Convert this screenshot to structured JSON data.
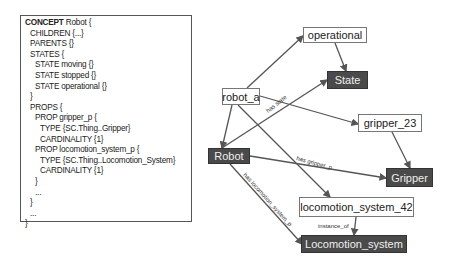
{
  "code": {
    "lines": [
      {
        "indent": 0,
        "keyword": "CONCEPT",
        "rest": " Robot {",
        "bold": true
      },
      {
        "indent": 1,
        "keyword": "CHILDREN",
        "rest": " {...}"
      },
      {
        "indent": 1,
        "keyword": "PARENTS",
        "rest": " {}"
      },
      {
        "indent": 1,
        "keyword": "STATES",
        "rest": " {"
      },
      {
        "indent": 2,
        "keyword": "STATE",
        "rest": " moving {}"
      },
      {
        "indent": 2,
        "keyword": "STATE",
        "rest": " stopped {}"
      },
      {
        "indent": 2,
        "keyword": "STATE",
        "rest": " operational {}"
      },
      {
        "indent": 1,
        "keyword": "",
        "rest": "}"
      },
      {
        "indent": 1,
        "keyword": "PROPS",
        "rest": " {"
      },
      {
        "indent": 2,
        "keyword": "PROP",
        "rest": " gripper_p {"
      },
      {
        "indent": 3,
        "keyword": "TYPE",
        "rest": " {SC.Thing..Gripper}"
      },
      {
        "indent": 3,
        "keyword": "CARDINALITY",
        "rest": " {1}"
      },
      {
        "indent": 2,
        "keyword": "PROP",
        "rest": " locomotion_system_p {"
      },
      {
        "indent": 3,
        "keyword": "TYPE",
        "rest": " {SC.Thing..Locomotion_System}"
      },
      {
        "indent": 3,
        "keyword": "CARDINALITY",
        "rest": " {1}"
      },
      {
        "indent": 2,
        "keyword": "",
        "rest": "}"
      },
      {
        "indent": 2,
        "keyword": "",
        "rest": "..."
      },
      {
        "indent": 1,
        "keyword": "",
        "rest": "}"
      },
      {
        "indent": 1,
        "keyword": "",
        "rest": "..."
      },
      {
        "indent": 0,
        "keyword": "",
        "rest": "}"
      }
    ]
  },
  "graph": {
    "nodes": [
      {
        "id": "operational",
        "label": "operational",
        "kind": "instance",
        "x": 303,
        "y": 27,
        "w": 64,
        "h": 16
      },
      {
        "id": "State",
        "label": "State",
        "kind": "concept",
        "x": 327,
        "y": 71,
        "w": 41,
        "h": 18
      },
      {
        "id": "robot_a",
        "label": "robot_a",
        "kind": "instance",
        "x": 222,
        "y": 88,
        "w": 38,
        "h": 17
      },
      {
        "id": "gripper_23",
        "label": "gripper_23",
        "kind": "instance",
        "x": 358,
        "y": 114,
        "w": 64,
        "h": 18
      },
      {
        "id": "Robot",
        "label": "Robot",
        "kind": "concept",
        "x": 208,
        "y": 148,
        "w": 42,
        "h": 16
      },
      {
        "id": "Gripper",
        "label": "Gripper",
        "kind": "concept",
        "x": 386,
        "y": 168,
        "w": 47,
        "h": 19
      },
      {
        "id": "locomotion_system_42",
        "label": "locomotion_system_42",
        "kind": "instance",
        "x": 299,
        "y": 197,
        "w": 115,
        "h": 20
      },
      {
        "id": "Locomotion_system",
        "label": "Locomotion_system",
        "kind": "concept",
        "x": 301,
        "y": 235,
        "w": 106,
        "h": 18
      }
    ],
    "edges": [
      {
        "from": [
          247,
          88
        ],
        "to": [
          303,
          36
        ],
        "label": ""
      },
      {
        "from": [
          335,
          43
        ],
        "to": [
          346,
          71
        ],
        "label": ""
      },
      {
        "from": [
          260,
          96
        ],
        "to": [
          358,
          124
        ],
        "label": "has state",
        "lx": 268,
        "ly": 113,
        "angle": -38
      },
      {
        "from": [
          232,
          105
        ],
        "to": [
          222,
          148
        ],
        "label": ""
      },
      {
        "from": [
          238,
          105
        ],
        "to": [
          330,
          197
        ],
        "label": ""
      },
      {
        "from": [
          222,
          148
        ],
        "to": [
          327,
          80
        ],
        "label": ""
      },
      {
        "from": [
          250,
          156
        ],
        "to": [
          386,
          178
        ],
        "label": "has gripper_p",
        "lx": 296,
        "ly": 160,
        "angle": 15
      },
      {
        "from": [
          392,
          132
        ],
        "to": [
          410,
          168
        ],
        "label": ""
      },
      {
        "from": [
          230,
          164
        ],
        "to": [
          302,
          244
        ],
        "label": "has locomotion_system_p",
        "lx": 243,
        "ly": 175,
        "angle": 48
      },
      {
        "from": [
          356,
          217
        ],
        "to": [
          354,
          235
        ],
        "label": "instance_of",
        "lx": 318,
        "ly": 228,
        "angle": 0
      }
    ],
    "colors": {
      "edge": "#555555",
      "concept_bg": "#4a4a4a",
      "concept_text": "#eeeeee",
      "instance_border": "#777777"
    }
  }
}
